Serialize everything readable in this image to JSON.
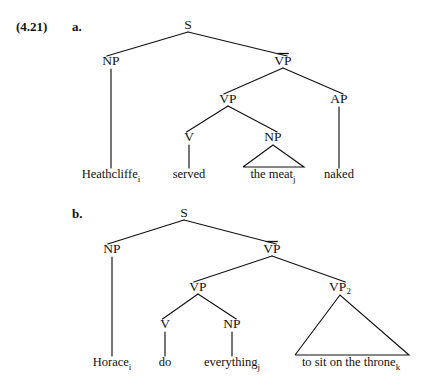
{
  "figure": {
    "example_number": "(4.21)",
    "background_color": "#ffffff",
    "ink_color": "#111111",
    "width": 432,
    "height": 390
  },
  "trees": [
    {
      "letter": "a.",
      "letter_pos": {
        "x": 72,
        "y": 31
      },
      "number_pos": {
        "x": 16,
        "y": 31
      },
      "show_number": true,
      "nodes": [
        {
          "id": "a-s",
          "label": "S",
          "sub": "",
          "overline": false,
          "x": 188,
          "y": 29
        },
        {
          "id": "a-np1",
          "label": "NP",
          "sub": "",
          "overline": false,
          "x": 111,
          "y": 65
        },
        {
          "id": "a-vpb",
          "label": "VP",
          "sub": "",
          "overline": true,
          "x": 283,
          "y": 65
        },
        {
          "id": "a-vp2",
          "label": "VP",
          "sub": "",
          "overline": false,
          "x": 228,
          "y": 103
        },
        {
          "id": "a-ap",
          "label": "AP",
          "sub": "",
          "overline": false,
          "x": 339,
          "y": 103
        },
        {
          "id": "a-v",
          "label": "V",
          "sub": "",
          "overline": false,
          "x": 189,
          "y": 141
        },
        {
          "id": "a-np2",
          "label": "NP",
          "sub": "",
          "overline": false,
          "x": 273,
          "y": 141
        }
      ],
      "branches": [
        {
          "from": "a-s",
          "to": "a-np1"
        },
        {
          "from": "a-s",
          "to": "a-vpb"
        },
        {
          "from": "a-vpb",
          "to": "a-vp2"
        },
        {
          "from": "a-vpb",
          "to": "a-ap"
        },
        {
          "from": "a-vp2",
          "to": "a-v"
        },
        {
          "from": "a-vp2",
          "to": "a-np2"
        }
      ],
      "leaves": [
        {
          "id": "a-leaf-1",
          "text": "Heathcliffe",
          "sub": "i",
          "x": 111,
          "y": 178,
          "parent": "a-np1",
          "triangle": null
        },
        {
          "id": "a-leaf-2",
          "text": "served",
          "sub": "",
          "x": 189,
          "y": 178,
          "parent": "a-v",
          "triangle": null
        },
        {
          "id": "a-leaf-3",
          "text": "the meat",
          "sub": "j",
          "x": 273,
          "y": 178,
          "parent": "a-np2",
          "triangle": {
            "left": 243,
            "right": 304,
            "base_y": 167
          }
        },
        {
          "id": "a-leaf-4",
          "text": "naked",
          "sub": "",
          "x": 339,
          "y": 178,
          "parent": "a-ap",
          "triangle": null
        }
      ]
    },
    {
      "letter": "b.",
      "letter_pos": {
        "x": 72,
        "y": 218
      },
      "number_pos": {
        "x": 16,
        "y": 218
      },
      "show_number": false,
      "nodes": [
        {
          "id": "b-s",
          "label": "S",
          "sub": "",
          "overline": false,
          "x": 184,
          "y": 217
        },
        {
          "id": "b-np1",
          "label": "NP",
          "sub": "",
          "overline": false,
          "x": 112,
          "y": 253
        },
        {
          "id": "b-vpb",
          "label": "VP",
          "sub": "",
          "overline": true,
          "x": 272,
          "y": 253
        },
        {
          "id": "b-vp2",
          "label": "VP",
          "sub": "",
          "overline": false,
          "x": 198,
          "y": 291
        },
        {
          "id": "b-vp3",
          "label": "VP",
          "sub": "2",
          "overline": false,
          "x": 340,
          "y": 291
        },
        {
          "id": "b-v",
          "label": "V",
          "sub": "",
          "overline": false,
          "x": 165,
          "y": 328
        },
        {
          "id": "b-np2",
          "label": "NP",
          "sub": "",
          "overline": false,
          "x": 232,
          "y": 328
        }
      ],
      "branches": [
        {
          "from": "b-s",
          "to": "b-np1"
        },
        {
          "from": "b-s",
          "to": "b-vpb"
        },
        {
          "from": "b-vpb",
          "to": "b-vp2"
        },
        {
          "from": "b-vpb",
          "to": "b-vp3"
        },
        {
          "from": "b-vp2",
          "to": "b-v"
        },
        {
          "from": "b-vp2",
          "to": "b-np2"
        }
      ],
      "leaves": [
        {
          "id": "b-leaf-1",
          "text": "Horace",
          "sub": "i",
          "x": 112,
          "y": 366,
          "parent": "b-np1",
          "triangle": null
        },
        {
          "id": "b-leaf-2",
          "text": "do",
          "sub": "",
          "x": 165,
          "y": 366,
          "parent": "b-v",
          "triangle": null
        },
        {
          "id": "b-leaf-3",
          "text": "everything",
          "sub": "j",
          "x": 232,
          "y": 366,
          "parent": "b-np2",
          "triangle": null
        },
        {
          "id": "b-leaf-4",
          "text": "to sit on the throne",
          "sub": "k",
          "x": 351,
          "y": 366,
          "parent": "b-vp3",
          "triangle": {
            "left": 295,
            "right": 409,
            "base_y": 355
          }
        }
      ]
    }
  ]
}
